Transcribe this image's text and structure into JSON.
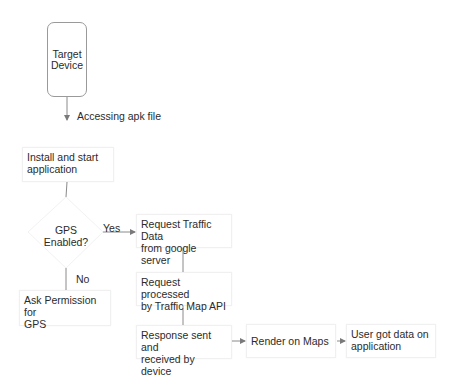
{
  "diagram": {
    "type": "flowchart",
    "nodes": {
      "target_device": "Target\nDevice",
      "target_device_l1": "Target",
      "target_device_l2": "Device",
      "install": "Install and start application",
      "install_l1": "Install and start",
      "install_l2": "application",
      "gps_l1": "GPS",
      "gps_l2": "Enabled?",
      "ask_permission_l1": "Ask Permission for",
      "ask_permission_l2": "GPS",
      "request_traffic_l1": "Request Traffic Data",
      "request_traffic_l2": "from google server",
      "processed_l1": "Request processed",
      "processed_l2": "by Traffic Map API",
      "response_l1": "Response sent and",
      "response_l2": "received by device",
      "render": "Render on Maps",
      "user_l1": "User got data on",
      "user_l2": "application"
    },
    "edges": {
      "accessing": "Accessing apk file",
      "yes": "Yes",
      "no": "No"
    },
    "colors": {
      "line": "#8a8a8a",
      "text": "#2b2b2b",
      "box_border": "#f0f0f0"
    }
  }
}
